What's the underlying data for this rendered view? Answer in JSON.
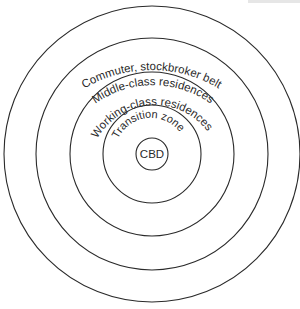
{
  "diagram": {
    "type": "concentric-zone-model",
    "center": {
      "x": 152,
      "y": 154
    },
    "stroke_color": "#2a2a2a",
    "background": "#ffffff",
    "zones": [
      {
        "label": "CBD",
        "radius": 16
      },
      {
        "label": "Transition zone",
        "radius": 49
      },
      {
        "label": "Working-class residences",
        "radius": 82
      },
      {
        "label": "Middle-class residences",
        "radius": 116
      },
      {
        "label": "Commuter, stockbroker belt",
        "radius": 148
      }
    ]
  }
}
